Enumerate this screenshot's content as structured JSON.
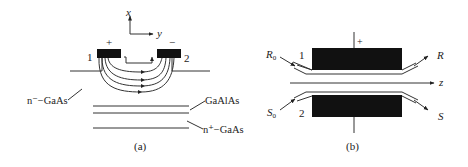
{
  "figure": {
    "panels": [
      {
        "id": "a",
        "caption": "(a)",
        "axes": {
          "x_label": "x",
          "y_label": "y"
        },
        "electrodes": [
          {
            "number": "1",
            "polarity": "+"
          },
          {
            "number": "2",
            "polarity": "−"
          }
        ],
        "layers": {
          "top": "n⁻−GaAs",
          "middle": "GaAlAs",
          "bottom": "n⁺−GaAs"
        }
      },
      {
        "id": "b",
        "caption": "(b)",
        "polarity": "+",
        "axis_label": "z",
        "ports": {
          "input_top": "R",
          "input_top_sub": "0",
          "output_top": "R",
          "input_bottom": "S",
          "input_bottom_sub": "0",
          "output_bottom": "S"
        },
        "guide_numbers": [
          "1",
          "2"
        ]
      }
    ]
  }
}
